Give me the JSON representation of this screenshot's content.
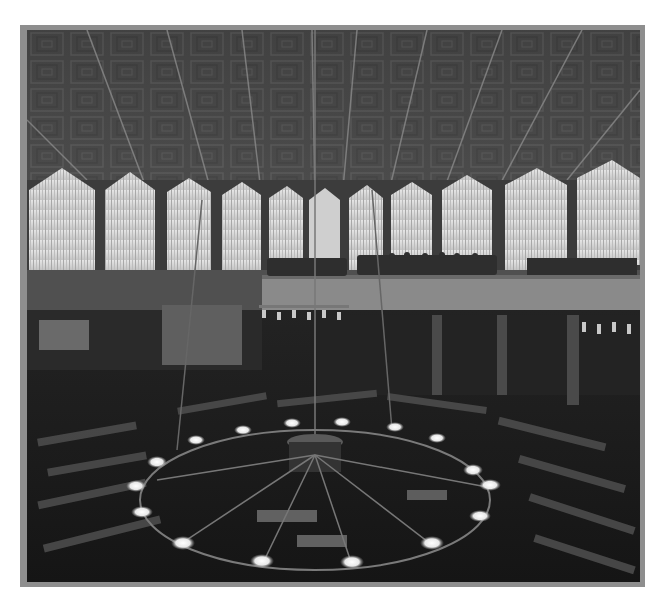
{
  "image": {
    "kind": "photograph",
    "tone": "black-and-white",
    "subject": "interior of an assembly hall with a coffered pitched ceiling, tall curtained windows, an upper gallery with seated spectators, rows of desks on the floor and a large ring chandelier in the foreground"
  },
  "colors": {
    "frame": "#8e8e8e",
    "ceiling": "#4a4a4a",
    "window": "#d9d9d9",
    "floor": "#1c1c1c",
    "lamp_glow": "#f2f2f2"
  },
  "scene": {
    "windows_count": 10,
    "chandelier_lamps_count": 16
  }
}
